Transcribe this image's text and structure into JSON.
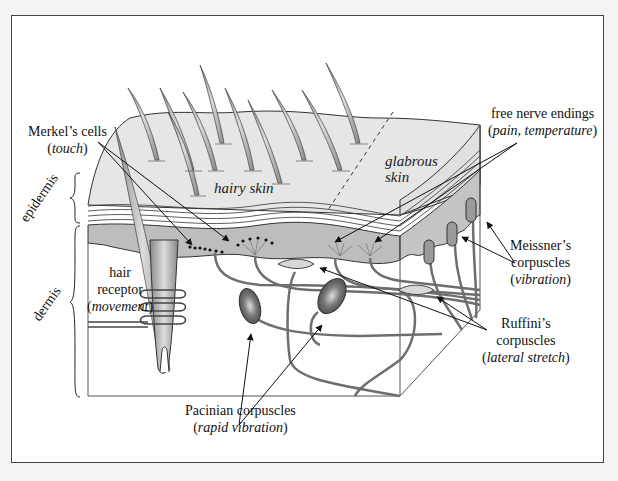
{
  "diagram": {
    "regions": {
      "hairy_skin": "hairy skin",
      "glabrous_line1": "glabrous",
      "glabrous_line2": "skin"
    },
    "layers": {
      "epidermis": "epidermis",
      "dermis": "dermis"
    },
    "labels": {
      "merkel": {
        "name": "Merkel’s cells",
        "function": "touch"
      },
      "free_nerve": {
        "name": "free nerve endings",
        "function": "pain, temperature"
      },
      "meissner": {
        "name_line1": "Meissner’s",
        "name_line2": "corpuscles",
        "function": "vibration"
      },
      "hair_receptor": {
        "name_line1": "hair",
        "name_line2": "receptor",
        "function": "movement"
      },
      "ruffini": {
        "name_line1": "Ruffini’s",
        "name_line2": "corpuscles",
        "function": "lateral stretch"
      },
      "pacinian": {
        "name": "Pacinian corpuscles",
        "function": "rapid vibration"
      }
    },
    "colors": {
      "skin_surface": "#e6e6e6",
      "epidermis_band": "#bdbdbd",
      "nerve": "#6e6e6e",
      "outline": "#333333"
    }
  }
}
